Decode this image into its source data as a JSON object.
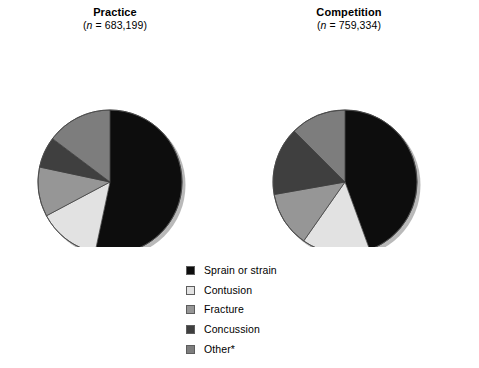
{
  "figure": {
    "background": "#ffffff"
  },
  "panels": [
    {
      "key": "practice",
      "title": "Practice",
      "n_prefix": "(",
      "n_var": "n",
      "n_eq": " = ",
      "n_value": "683,199",
      "n_suffix": ")",
      "subtitle_full": "(n = 683,199)"
    },
    {
      "key": "competition",
      "title": "Competition",
      "n_prefix": "(",
      "n_var": "n",
      "n_eq": " = ",
      "n_value": "759,334",
      "n_suffix": ")",
      "subtitle_full": "(n = 759,334)"
    }
  ],
  "legend": {
    "items": [
      {
        "label": "Sprain or strain",
        "color": "#0d0d0d"
      },
      {
        "label": "Contusion",
        "color": "#e2e2e2"
      },
      {
        "label": "Fracture",
        "color": "#969696"
      },
      {
        "label": "Concussion",
        "color": "#3f3f3f"
      },
      {
        "label": "Other*",
        "color": "#7d7d7d"
      }
    ]
  },
  "chart_data": {
    "type": "pie",
    "legend_position": "bottom-center",
    "categories": [
      "Sprain or strain",
      "Contusion",
      "Fracture",
      "Concussion",
      "Other*"
    ],
    "colors": [
      "#0d0d0d",
      "#e2e2e2",
      "#969696",
      "#3f3f3f",
      "#7d7d7d"
    ],
    "start_angle_deg": 0,
    "direction": "clockwise",
    "charts": [
      {
        "name": "Practice",
        "n": 683199,
        "n_label": "683,199",
        "percents": [
          53.3,
          13.9,
          11.1,
          6.9,
          14.8
        ],
        "angles_deg": [
          192,
          50,
          40,
          25,
          53
        ]
      },
      {
        "name": "Competition",
        "n": 759334,
        "n_label": "759,334",
        "percents": [
          44.4,
          15.3,
          12.5,
          15.3,
          12.5
        ],
        "angles_deg": [
          160,
          55,
          45,
          55,
          45
        ]
      }
    ]
  }
}
